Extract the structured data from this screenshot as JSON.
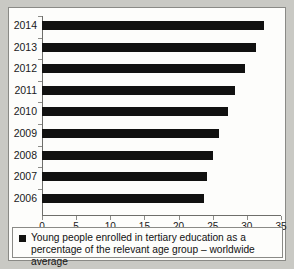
{
  "chart_data": {
    "type": "bar",
    "orientation": "horizontal",
    "title": "",
    "xlabel": "",
    "ylabel": "",
    "xlim": [
      0,
      35
    ],
    "grid": false,
    "legend_position": "bottom",
    "xticks": [
      "0",
      "5",
      "10",
      "15",
      "20",
      "25",
      "30",
      "35"
    ],
    "categories": [
      "2014",
      "2013",
      "2012",
      "2011",
      "2010",
      "2009",
      "2008",
      "2007",
      "2006"
    ],
    "values": [
      32.5,
      31.3,
      29.7,
      28.2,
      27.2,
      25.9,
      25.1,
      24.1,
      23.7
    ],
    "series": [
      {
        "name": "Young people enrolled in tertiary education as a percentage of the relevant age group – worldwide average",
        "color": "#111110",
        "values": [
          32.5,
          31.3,
          29.7,
          28.2,
          27.2,
          25.9,
          25.1,
          24.1,
          23.7
        ]
      }
    ],
    "legend": [
      {
        "label_line1": "Young people enrolled in tertiary education as a percentage",
        "label_line2": "of the relevant age group – worldwide average",
        "swatch_color": "#121210"
      }
    ]
  },
  "colors": {
    "page_background": "#c9c9c4",
    "card_background": "#fdfdfb",
    "bar": "#111110",
    "axis": "#6e6e6a",
    "text": "#19191a"
  }
}
